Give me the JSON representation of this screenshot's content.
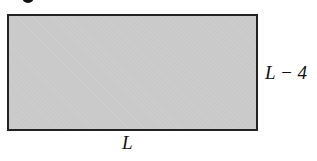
{
  "figure": {
    "shape": "rectangle",
    "fill_color": "#c9c9c9",
    "border_color": "#222222",
    "labels": {
      "height": "L − 4",
      "width": "L"
    }
  }
}
